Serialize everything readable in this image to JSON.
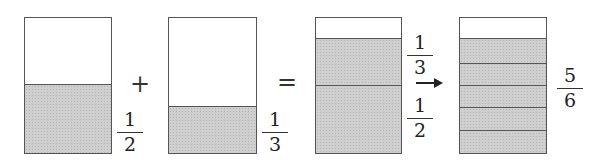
{
  "diagram": {
    "operators": {
      "plus": "+",
      "equals": "="
    },
    "bars": [
      {
        "id": "half",
        "shaded_fraction": "1/2",
        "label": {
          "numerator": "1",
          "denominator": "2"
        }
      },
      {
        "id": "third",
        "shaded_fraction": "1/3",
        "label": {
          "numerator": "1",
          "denominator": "3"
        }
      },
      {
        "id": "sum",
        "parts": [
          {
            "numerator": "1",
            "denominator": "3"
          },
          {
            "numerator": "1",
            "denominator": "2"
          }
        ]
      },
      {
        "id": "result",
        "divisions": 6,
        "shaded": 5,
        "label": {
          "numerator": "5",
          "denominator": "6"
        }
      }
    ],
    "arrow": "right-arrow",
    "colors": {
      "shade": "#cfcfcf",
      "outline": "#555555",
      "text": "#222222"
    }
  }
}
